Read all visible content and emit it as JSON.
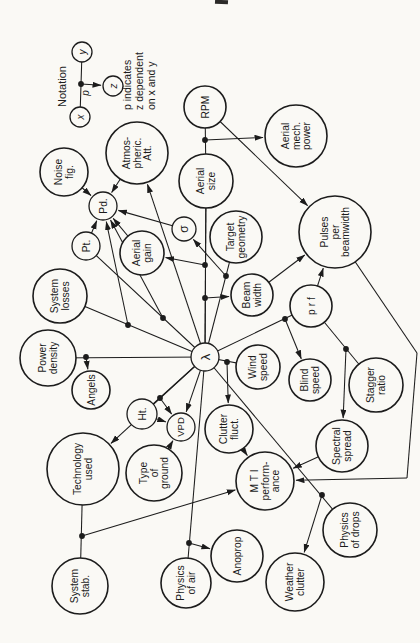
{
  "page": {
    "width": 420,
    "height": 643,
    "background": "#faf9f5",
    "ink": "#1c1c1c"
  },
  "legend": {
    "title": "Notation",
    "caption_lines": [
      "p indicates",
      "z dependent",
      "on x and y"
    ],
    "nodes": [
      {
        "id": "lx",
        "label": "x",
        "x": 80,
        "y": 117,
        "r": 10
      },
      {
        "id": "ly",
        "label": "y",
        "x": 82,
        "y": 52,
        "r": 10
      },
      {
        "id": "lz",
        "label": "z",
        "x": 113,
        "y": 86,
        "r": 10
      }
    ],
    "link": {
      "a": "lx",
      "b": "ly"
    },
    "dot": {
      "x": 81,
      "y": 84,
      "label": "p",
      "label_x": 89,
      "label_y": 93
    },
    "arrow": {
      "from_dot": true,
      "to": "lz"
    },
    "title_pos": {
      "x": 66,
      "y": 107
    },
    "caption_pos": {
      "xs": [
        131,
        143,
        155
      ],
      "y_bottom": 110
    }
  },
  "diagram": {
    "nodes": [
      {
        "id": "rpm",
        "lines": [
          "RPM"
        ],
        "x": 205,
        "y": 107,
        "r": 21
      },
      {
        "id": "aerial_mech",
        "lines": [
          "Aerial",
          "mech.",
          "power"
        ],
        "x": 296,
        "y": 136,
        "r": 31
      },
      {
        "id": "noise_fig",
        "lines": [
          "Noise",
          "fig."
        ],
        "x": 64,
        "y": 172,
        "r": 24
      },
      {
        "id": "atmos",
        "lines": [
          "Atmos-",
          "pheric.",
          "Att."
        ],
        "x": 137,
        "y": 153,
        "r": 31
      },
      {
        "id": "aerial_size",
        "lines": [
          "Aerial",
          "size"
        ],
        "x": 206,
        "y": 181,
        "r": 27
      },
      {
        "id": "pd",
        "lines": [
          "Pd."
        ],
        "x": 103,
        "y": 206,
        "r": 14
      },
      {
        "id": "pt",
        "lines": [
          "Pt."
        ],
        "x": 86,
        "y": 246,
        "r": 14
      },
      {
        "id": "aerial_gain",
        "lines": [
          "Aerial",
          "gain"
        ],
        "x": 142,
        "y": 253,
        "r": 22
      },
      {
        "id": "sigma",
        "lines": [
          "σ"
        ],
        "x": 184,
        "y": 229,
        "r": 12,
        "fs": 12
      },
      {
        "id": "target_geom",
        "lines": [
          "Target",
          "geometry"
        ],
        "x": 236,
        "y": 237,
        "r": 26
      },
      {
        "id": "pulses_bw",
        "lines": [
          "Pulses",
          "per",
          "beamwidth"
        ],
        "x": 335,
        "y": 232,
        "r": 36
      },
      {
        "id": "sys_losses",
        "lines": [
          "System",
          "losses"
        ],
        "x": 60,
        "y": 296,
        "r": 27
      },
      {
        "id": "beam_width",
        "lines": [
          "Beam",
          "width"
        ],
        "x": 252,
        "y": 295,
        "r": 21
      },
      {
        "id": "prf",
        "lines": [
          "p r f"
        ],
        "x": 311,
        "y": 306,
        "r": 21
      },
      {
        "id": "power_density",
        "lines": [
          "Power",
          "density"
        ],
        "x": 48,
        "y": 358,
        "r": 28
      },
      {
        "id": "angels",
        "lines": [
          "Angels"
        ],
        "x": 91,
        "y": 390,
        "r": 19
      },
      {
        "id": "lambda",
        "lines": [
          "λ"
        ],
        "x": 205,
        "y": 357,
        "r": 14,
        "fs": 13
      },
      {
        "id": "wind_speed",
        "lines": [
          "Wind",
          "speed"
        ],
        "x": 258,
        "y": 367,
        "r": 22
      },
      {
        "id": "blind_speed",
        "lines": [
          "Blind",
          "speed"
        ],
        "x": 310,
        "y": 380,
        "r": 21
      },
      {
        "id": "stagger",
        "lines": [
          "Stagger",
          "ratio"
        ],
        "x": 376,
        "y": 385,
        "r": 27
      },
      {
        "id": "ht",
        "lines": [
          "Ht."
        ],
        "x": 142,
        "y": 414,
        "r": 15
      },
      {
        "id": "vpd",
        "lines": [
          "VPD"
        ],
        "x": 181,
        "y": 427,
        "r": 14,
        "fs": 9.5
      },
      {
        "id": "clutter_fluct",
        "lines": [
          "Clutter",
          "fluct."
        ],
        "x": 229,
        "y": 429,
        "r": 24
      },
      {
        "id": "spectral",
        "lines": [
          "Spectral",
          "spread"
        ],
        "x": 342,
        "y": 446,
        "r": 26
      },
      {
        "id": "tech_used",
        "lines": [
          "Technology",
          "used"
        ],
        "x": 83,
        "y": 469,
        "r": 36
      },
      {
        "id": "type_ground",
        "lines": [
          "Type",
          "of",
          "ground"
        ],
        "x": 154,
        "y": 473,
        "r": 28
      },
      {
        "id": "mti",
        "lines": [
          "M T I",
          "perform-",
          "ance"
        ],
        "x": 265,
        "y": 481,
        "r": 29
      },
      {
        "id": "sys_stab",
        "lines": [
          "System",
          "stab."
        ],
        "x": 80,
        "y": 586,
        "r": 28
      },
      {
        "id": "physics_air",
        "lines": [
          "Physics",
          "of air"
        ],
        "x": 186,
        "y": 583,
        "r": 25
      },
      {
        "id": "anoprop",
        "lines": [
          "Anoprop"
        ],
        "x": 237,
        "y": 556,
        "r": 26
      },
      {
        "id": "weather_clutter",
        "lines": [
          "Weather",
          "clutter"
        ],
        "x": 295,
        "y": 582,
        "r": 29
      },
      {
        "id": "physics_drops",
        "lines": [
          "Physics",
          "of drops"
        ],
        "x": 350,
        "y": 530,
        "r": 27
      }
    ],
    "junctions": [
      {
        "a": "rpm",
        "b": "aerial_size",
        "dot": [
          205,
          140
        ],
        "to": "aerial_mech"
      },
      {
        "a": "aerial_size",
        "b": "lambda",
        "dot": [
          205,
          265
        ],
        "to": "aerial_gain"
      },
      {
        "a": "aerial_size",
        "b": "lambda",
        "dot": [
          205,
          298
        ],
        "to": "beam_width"
      },
      {
        "a": "target_geom",
        "b": "lambda",
        "dot": [
          226,
          276
        ],
        "to": "sigma"
      },
      {
        "a": "pt",
        "b": "lambda",
        "dot": [
          163,
          318
        ],
        "to": "pd"
      },
      {
        "a": "sys_losses",
        "b": "lambda",
        "dot": [
          128,
          325
        ],
        "to": "pd"
      },
      {
        "a": "power_density",
        "b": "lambda",
        "dot": [
          86,
          357
        ],
        "to": "angels"
      },
      {
        "a": "ht",
        "b": "lambda",
        "dot": [
          160,
          398
        ],
        "to": "vpd"
      },
      {
        "a": "prf",
        "b": "lambda",
        "dot": [
          285,
          319
        ],
        "to": "blind_speed"
      },
      {
        "a": "wind_speed",
        "b": "lambda",
        "dot": [
          227,
          362
        ],
        "to": "clutter_fluct"
      },
      {
        "a": "physics_air",
        "b": "lambda",
        "dot": [
          189,
          543
        ],
        "to": "anoprop"
      },
      {
        "a": "physics_drops",
        "b": "lambda",
        "dot": [
          322,
          495
        ],
        "to": "weather_clutter"
      },
      {
        "a": "prf",
        "b": "stagger",
        "dot": [
          346,
          349
        ],
        "to": "spectral"
      },
      {
        "a": "tech_used",
        "b": "sys_stab",
        "dot": [
          82,
          536
        ],
        "to": "mti"
      }
    ],
    "arrows": [
      {
        "a": "noise_fig",
        "b": "pd"
      },
      {
        "a": "atmos",
        "b": "pd"
      },
      {
        "a": "pt",
        "b": "pd"
      },
      {
        "a": "aerial_gain",
        "b": "pd"
      },
      {
        "a": "sigma",
        "b": "pd"
      },
      {
        "a": "lambda",
        "b": "atmos"
      },
      {
        "a": "lambda",
        "b": "vpd"
      },
      {
        "a": "lambda",
        "b": "tech_used"
      },
      {
        "a": "ht",
        "b": "vpd"
      },
      {
        "a": "type_ground",
        "b": "vpd"
      },
      {
        "a": "rpm",
        "b": "pulses_bw"
      },
      {
        "a": "beam_width",
        "b": "pulses_bw"
      },
      {
        "a": "prf",
        "b": "pulses_bw"
      },
      {
        "a": "spectral",
        "b": "mti"
      },
      {
        "a": "clutter_fluct",
        "b": "mti"
      },
      {
        "a": "pulses_bw",
        "b": "mti",
        "via": [
          [
            417,
            353
          ],
          [
            407,
            478
          ]
        ]
      }
    ]
  }
}
